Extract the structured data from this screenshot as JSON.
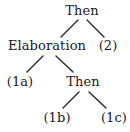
{
  "figure": {
    "type": "binary-discourse-tree",
    "background_color": "#ffffff",
    "text_color": "#1a1a1a",
    "edge_color": "#2b2b2b"
  },
  "nodes": {
    "root": "Then",
    "elaboration": "Elaboration",
    "two": "(2)",
    "one_a": "(1a)",
    "then_inner": "Then",
    "one_b": "(1b)",
    "one_c": "(1c)"
  },
  "tree_data": {
    "label": "Then",
    "children": [
      {
        "label": "Elaboration",
        "children": [
          {
            "label": "(1a)",
            "children": []
          },
          {
            "label": "Then",
            "children": [
              {
                "label": "(1b)",
                "children": []
              },
              {
                "label": "(1c)",
                "children": []
              }
            ]
          }
        ]
      },
      {
        "label": "(2)",
        "children": []
      }
    ]
  },
  "edges": [
    {
      "from": "Then",
      "to": "Elaboration"
    },
    {
      "from": "Then",
      "to": "(2)"
    },
    {
      "from": "Elaboration",
      "to": "(1a)"
    },
    {
      "from": "Elaboration",
      "to": "Then"
    },
    {
      "from": "Then",
      "to": "(1b)"
    },
    {
      "from": "Then",
      "to": "(1c)"
    }
  ]
}
